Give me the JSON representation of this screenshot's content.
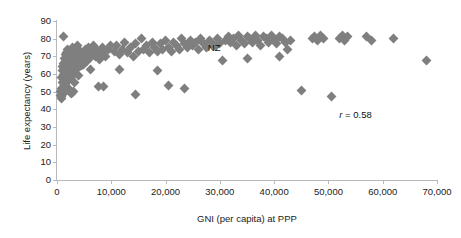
{
  "chart_data": {
    "type": "scatter",
    "title": "",
    "xlabel": "GNI (per capita) at PPP",
    "ylabel": "Life expectancy (years)",
    "xlim": [
      0,
      70000
    ],
    "ylim": [
      0,
      90
    ],
    "xticks": [
      0,
      10000,
      20000,
      30000,
      40000,
      50000,
      60000,
      70000
    ],
    "xticklabels": [
      "0",
      "10,000",
      "20,000",
      "30,000",
      "40,000",
      "50,000",
      "60,000",
      "70,000"
    ],
    "yticks": [
      0,
      10,
      20,
      30,
      40,
      50,
      60,
      70,
      80,
      90
    ],
    "yticklabels": [
      "0",
      "10",
      "20",
      "30",
      "40",
      "50",
      "60",
      "70",
      "80",
      "90"
    ],
    "grid": false,
    "legend": null,
    "marker": "diamond",
    "marker_color": "#7f7f7f",
    "correlation_label": "r = 0.58",
    "correlation_symbol": "r",
    "correlation_value": "= 0.58",
    "annotations": [
      {
        "text": "NZ",
        "x": 26500,
        "y": 74.5
      }
    ],
    "points": [
      [
        600,
        48
      ],
      [
        700,
        50
      ],
      [
        750,
        46
      ],
      [
        800,
        52
      ],
      [
        850,
        58
      ],
      [
        900,
        47
      ],
      [
        950,
        55
      ],
      [
        1000,
        62
      ],
      [
        1050,
        49
      ],
      [
        1100,
        64
      ],
      [
        1150,
        51
      ],
      [
        1200,
        60
      ],
      [
        1250,
        66
      ],
      [
        1300,
        54
      ],
      [
        1350,
        69
      ],
      [
        1400,
        57
      ],
      [
        1450,
        63
      ],
      [
        1500,
        71
      ],
      [
        1550,
        50
      ],
      [
        1600,
        59
      ],
      [
        1650,
        67
      ],
      [
        1700,
        53
      ],
      [
        1750,
        72
      ],
      [
        1800,
        61
      ],
      [
        1850,
        65
      ],
      [
        1900,
        56
      ],
      [
        1950,
        70
      ],
      [
        2000,
        74
      ],
      [
        2050,
        52
      ],
      [
        2100,
        68
      ],
      [
        2200,
        62
      ],
      [
        2300,
        73
      ],
      [
        2400,
        58
      ],
      [
        2500,
        66
      ],
      [
        2600,
        71
      ],
      [
        2700,
        49
      ],
      [
        2800,
        64
      ],
      [
        2900,
        75
      ],
      [
        3000,
        69
      ],
      [
        3100,
        60
      ],
      [
        3200,
        72
      ],
      [
        3300,
        55
      ],
      [
        3400,
        67
      ],
      [
        3500,
        74
      ],
      [
        3600,
        63
      ],
      [
        3700,
        70
      ],
      [
        3800,
        76
      ],
      [
        3900,
        59
      ],
      [
        4000,
        71
      ],
      [
        4200,
        68
      ],
      [
        4400,
        73
      ],
      [
        4600,
        65
      ],
      [
        4800,
        72
      ],
      [
        5000,
        70
      ],
      [
        5200,
        74
      ],
      [
        5400,
        67
      ],
      [
        5600,
        71
      ],
      [
        5800,
        75
      ],
      [
        6000,
        69
      ],
      [
        6200,
        73
      ],
      [
        6500,
        72
      ],
      [
        6800,
        76
      ],
      [
        7000,
        70
      ],
      [
        7200,
        74
      ],
      [
        7500,
        71
      ],
      [
        7800,
        68
      ],
      [
        8000,
        73
      ],
      [
        8300,
        75
      ],
      [
        8600,
        72
      ],
      [
        9000,
        70
      ],
      [
        9400,
        74
      ],
      [
        9800,
        76
      ],
      [
        1200,
        81.5
      ],
      [
        2400,
        49.5
      ],
      [
        3000,
        50
      ],
      [
        4200,
        64
      ],
      [
        4800,
        65.5
      ],
      [
        6200,
        62.5
      ],
      [
        7600,
        53
      ],
      [
        8600,
        53
      ],
      [
        11500,
        62.5
      ],
      [
        10500,
        73
      ],
      [
        11000,
        76
      ],
      [
        11500,
        71
      ],
      [
        12000,
        74
      ],
      [
        12500,
        78
      ],
      [
        13000,
        72
      ],
      [
        13500,
        75
      ],
      [
        14000,
        70
      ],
      [
        14500,
        77
      ],
      [
        15000,
        73
      ],
      [
        15500,
        80
      ],
      [
        16000,
        74
      ],
      [
        16500,
        76
      ],
      [
        17000,
        72
      ],
      [
        17500,
        78
      ],
      [
        18000,
        75
      ],
      [
        18500,
        73
      ],
      [
        19000,
        77
      ],
      [
        19500,
        74
      ],
      [
        20000,
        79
      ],
      [
        20500,
        75
      ],
      [
        21000,
        73
      ],
      [
        21500,
        78
      ],
      [
        22000,
        76
      ],
      [
        22500,
        74
      ],
      [
        23000,
        80
      ],
      [
        23500,
        77
      ],
      [
        24000,
        75
      ],
      [
        24500,
        79
      ],
      [
        25000,
        76
      ],
      [
        25500,
        78
      ],
      [
        26000,
        74
      ],
      [
        26500,
        80
      ],
      [
        27000,
        77
      ],
      [
        27500,
        75
      ],
      [
        28000,
        79
      ],
      [
        28500,
        78
      ],
      [
        29000,
        76
      ],
      [
        29500,
        80
      ],
      [
        30000,
        77
      ],
      [
        14500,
        48.5
      ],
      [
        18500,
        62
      ],
      [
        20500,
        53.5
      ],
      [
        23500,
        52
      ],
      [
        31000,
        79
      ],
      [
        31500,
        81
      ],
      [
        32000,
        78
      ],
      [
        32500,
        80
      ],
      [
        33000,
        76
      ],
      [
        33500,
        82
      ],
      [
        34000,
        79
      ],
      [
        34500,
        77
      ],
      [
        35000,
        81
      ],
      [
        35500,
        80
      ],
      [
        36000,
        78
      ],
      [
        36500,
        82
      ],
      [
        37000,
        79
      ],
      [
        37500,
        76
      ],
      [
        38000,
        81
      ],
      [
        38500,
        80
      ],
      [
        39000,
        78
      ],
      [
        39500,
        82
      ],
      [
        40000,
        79
      ],
      [
        40500,
        77
      ],
      [
        41000,
        81
      ],
      [
        41500,
        80
      ],
      [
        42000,
        78
      ],
      [
        42500,
        74
      ],
      [
        43000,
        79
      ],
      [
        30500,
        67.5
      ],
      [
        35000,
        68.5
      ],
      [
        41000,
        70
      ],
      [
        47000,
        80
      ],
      [
        47500,
        81
      ],
      [
        48000,
        79
      ],
      [
        48500,
        82
      ],
      [
        49000,
        80
      ],
      [
        52000,
        80
      ],
      [
        52500,
        82
      ],
      [
        53000,
        79
      ],
      [
        53500,
        81
      ],
      [
        57000,
        81
      ],
      [
        58000,
        79
      ],
      [
        62000,
        80
      ],
      [
        45000,
        50.5
      ],
      [
        50500,
        47.5
      ],
      [
        68000,
        67.5
      ]
    ]
  }
}
